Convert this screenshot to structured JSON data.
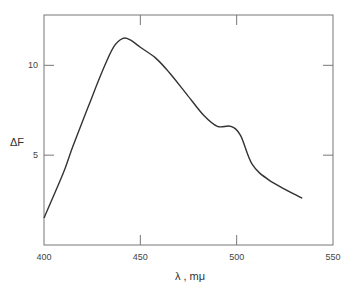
{
  "chart_data": {
    "type": "line",
    "title": "",
    "xlabel": "λ , mμ",
    "ylabel": "ΔF",
    "xlim": [
      400,
      550
    ],
    "ylim": [
      0,
      12.8
    ],
    "xticks": [
      400,
      450,
      500,
      550
    ],
    "xtick_labels": [
      "400",
      "450",
      "500",
      "550"
    ],
    "yticks": [
      5,
      10
    ],
    "ytick_labels": [
      "5",
      "10"
    ],
    "grid": false,
    "legend": null,
    "series": [
      {
        "name": "ΔF",
        "color": "#333333",
        "x": [
          400,
          410,
          415,
          423,
          430,
          436,
          441,
          445,
          450,
          458,
          465,
          474,
          483,
          490,
          497,
          502,
          508,
          517,
          534
        ],
        "y": [
          1.5,
          4.0,
          5.5,
          7.7,
          9.6,
          11.0,
          11.5,
          11.4,
          11.0,
          10.4,
          9.6,
          8.4,
          7.2,
          6.6,
          6.6,
          6.1,
          4.5,
          3.6,
          2.6
        ]
      }
    ]
  }
}
